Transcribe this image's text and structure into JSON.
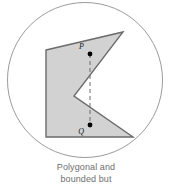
{
  "figure": {
    "title": "Polygonal and bounded but",
    "caption_lines": [
      "Polygonal and",
      "bounded but"
    ],
    "colors": {
      "circle_stroke": "#9b9b9b",
      "polygon_fill": "#d2d2d2",
      "polygon_stroke": "#6b6b6b",
      "point_fill": "#000000",
      "dash_stroke": "#6b6b6b",
      "caption_text": "#6e6e6e",
      "label_text": "#1a1a1a",
      "background": "#ffffff"
    },
    "circle": {
      "name": "boundary-circle",
      "cx": 85,
      "cy": 80,
      "r": 77.5,
      "stroke_width": 1
    },
    "polygon": {
      "name": "non-convex-polygon",
      "points": "46,50 123,32 74,96 133,137 46,137",
      "vertices": [
        {
          "label": "top-left",
          "x": 46,
          "y": 50
        },
        {
          "label": "top-right-spike",
          "x": 123,
          "y": 32
        },
        {
          "label": "reflex-notch",
          "x": 74,
          "y": 96
        },
        {
          "label": "bottom-right",
          "x": 133,
          "y": 137
        },
        {
          "label": "bottom-left",
          "x": 46,
          "y": 137
        }
      ],
      "stroke_width": 1.4
    },
    "points": [
      {
        "id": "P",
        "label": "P",
        "x": 90,
        "y": 54,
        "r": 2.4,
        "label_x": 84,
        "label_y": 49
      },
      {
        "id": "Q",
        "label": "Q",
        "x": 90,
        "y": 125,
        "r": 2.4,
        "label_x": 84,
        "label_y": 134
      }
    ],
    "segment": {
      "name": "dashed-segment-pq",
      "x1": 90,
      "y1": 54,
      "x2": 90,
      "y2": 125,
      "dash_pattern": "4,3",
      "stroke_width": 1
    }
  }
}
